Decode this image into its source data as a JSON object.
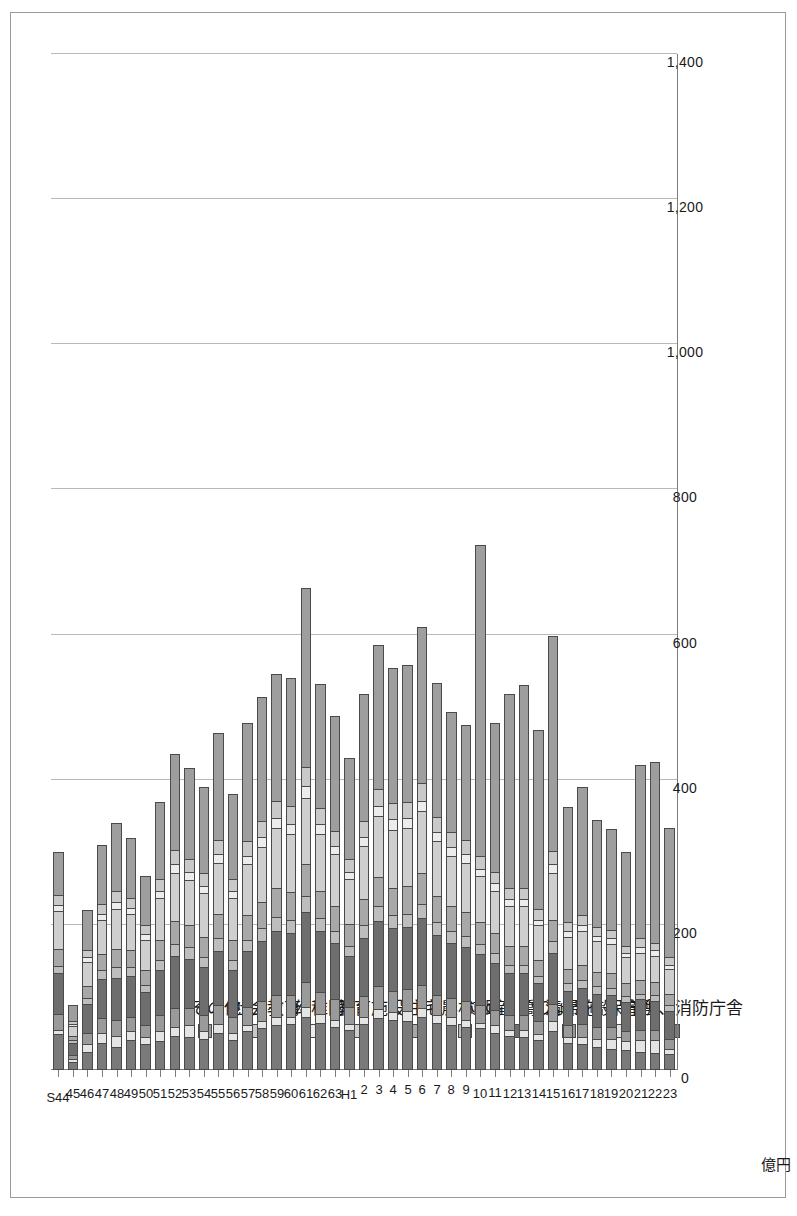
{
  "figure": {
    "unit_label": "億円",
    "orientation": "rotated-90",
    "frame_color": "#9a9a9a"
  },
  "legend": {
    "position": "upper-left",
    "items": [
      {
        "label": "その他",
        "color": "#9e9e9e"
      },
      {
        "label": "社会教育",
        "color": "#c9c9c9"
      },
      {
        "label": "幼稚園",
        "color": "#ececec"
      },
      {
        "label": "教育施設",
        "color": "#cfcfcf"
      },
      {
        "label": "住宅",
        "color": "#a8a8a8"
      },
      {
        "label": "農林水産",
        "color": "#bdbdbd"
      },
      {
        "label": "道路・橋りょう",
        "color": "#6e6e6e"
      },
      {
        "label": "清掃施設",
        "color": "#9a9a9a"
      },
      {
        "label": "保育所",
        "color": "#e4e4e4"
      },
      {
        "label": "庁舎、消防庁舎",
        "color": "#7a7a7a"
      }
    ]
  },
  "chart_data": {
    "type": "bar",
    "subtype": "stacked-horizontal",
    "title": "",
    "xlabel": "",
    "ylabel": "億円",
    "ylim": [
      0,
      1400
    ],
    "ticks": [
      "0",
      "200",
      "400",
      "600",
      "800",
      "1,000",
      "1,200",
      "1,400"
    ],
    "tick_values": [
      0,
      200,
      400,
      600,
      800,
      1000,
      1200,
      1400
    ],
    "grid": true,
    "legend_position": "upper-left",
    "categories": [
      "S44",
      "45",
      "46",
      "47",
      "48",
      "49",
      "50",
      "51",
      "52",
      "53",
      "54",
      "55",
      "56",
      "57",
      "58",
      "59",
      "60",
      "61",
      "62",
      "63",
      "H1",
      "2",
      "3",
      "4",
      "5",
      "6",
      "7",
      "8",
      "9",
      "10",
      "11",
      "12",
      "13",
      "14",
      "15",
      "16",
      "17",
      "18",
      "19",
      "20",
      "21",
      "22",
      "23"
    ],
    "series": [
      {
        "name": "庁舎、消防庁舎",
        "color": "#7a7a7a",
        "values": [
          48,
          10,
          24,
          36,
          30,
          40,
          34,
          38,
          46,
          44,
          42,
          50,
          40,
          52,
          56,
          60,
          62,
          72,
          64,
          58,
          54,
          62,
          70,
          68,
          66,
          72,
          64,
          60,
          58,
          56,
          50,
          46,
          44,
          40,
          52,
          36,
          34,
          30,
          28,
          26,
          24,
          22,
          20
        ]
      },
      {
        "name": "保育所",
        "color": "#e4e4e4",
        "values": [
          6,
          4,
          10,
          14,
          16,
          12,
          10,
          14,
          12,
          16,
          10,
          12,
          10,
          8,
          10,
          12,
          10,
          14,
          12,
          10,
          8,
          10,
          12,
          10,
          14,
          12,
          10,
          12,
          10,
          8,
          10,
          8,
          10,
          8,
          14,
          8,
          10,
          12,
          14,
          12,
          16,
          18,
          8
        ]
      },
      {
        "name": "清掃施設",
        "color": "#9a9a9a",
        "values": [
          22,
          6,
          16,
          20,
          22,
          20,
          16,
          22,
          26,
          24,
          22,
          26,
          22,
          26,
          28,
          30,
          30,
          34,
          30,
          28,
          24,
          28,
          32,
          30,
          30,
          32,
          28,
          26,
          26,
          24,
          22,
          20,
          20,
          18,
          24,
          16,
          18,
          16,
          16,
          14,
          14,
          14,
          14
        ]
      },
      {
        "name": "道路・橋りょう",
        "color": "#6e6e6e",
        "values": [
          56,
          16,
          40,
          54,
          58,
          56,
          46,
          62,
          72,
          68,
          66,
          74,
          64,
          76,
          82,
          88,
          86,
          96,
          84,
          78,
          70,
          80,
          90,
          86,
          86,
          92,
          82,
          76,
          74,
          70,
          64,
          58,
          58,
          52,
          70,
          48,
          50,
          46,
          44,
          40,
          42,
          40,
          38
        ]
      },
      {
        "name": "農林水産",
        "color": "#bdbdbd",
        "values": [
          10,
          4,
          8,
          12,
          14,
          12,
          10,
          14,
          16,
          16,
          14,
          18,
          14,
          16,
          18,
          20,
          18,
          22,
          18,
          16,
          14,
          18,
          20,
          18,
          18,
          20,
          18,
          16,
          16,
          14,
          14,
          12,
          12,
          10,
          16,
          10,
          10,
          10,
          10,
          8,
          8,
          8,
          8
        ]
      },
      {
        "name": "住宅",
        "color": "#a8a8a8",
        "values": [
          24,
          6,
          16,
          22,
          26,
          24,
          20,
          28,
          32,
          30,
          28,
          34,
          28,
          34,
          36,
          40,
          38,
          44,
          38,
          34,
          30,
          36,
          40,
          38,
          38,
          42,
          36,
          34,
          32,
          30,
          28,
          26,
          26,
          22,
          30,
          20,
          22,
          20,
          20,
          18,
          18,
          18,
          16
        ]
      },
      {
        "name": "教育施設",
        "color": "#cfcfcf",
        "values": [
          52,
          14,
          34,
          48,
          54,
          50,
          42,
          58,
          66,
          62,
          60,
          70,
          58,
          70,
          76,
          82,
          80,
          92,
          78,
          72,
          62,
          74,
          84,
          80,
          80,
          86,
          76,
          70,
          68,
          64,
          58,
          54,
          54,
          48,
          64,
          44,
          46,
          42,
          40,
          36,
          38,
          36,
          34
        ]
      },
      {
        "name": "幼稚園",
        "color": "#ececec",
        "values": [
          8,
          2,
          6,
          8,
          10,
          8,
          8,
          10,
          12,
          12,
          10,
          12,
          10,
          12,
          14,
          14,
          14,
          16,
          14,
          12,
          10,
          12,
          14,
          14,
          14,
          14,
          12,
          12,
          12,
          10,
          10,
          10,
          10,
          8,
          12,
          8,
          8,
          8,
          8,
          6,
          8,
          8,
          6
        ]
      },
      {
        "name": "社会教育",
        "color": "#c9c9c9",
        "values": [
          14,
          4,
          10,
          14,
          16,
          14,
          12,
          16,
          20,
          18,
          18,
          20,
          16,
          20,
          22,
          24,
          24,
          26,
          22,
          20,
          18,
          22,
          24,
          22,
          22,
          24,
          22,
          20,
          20,
          18,
          16,
          16,
          16,
          14,
          18,
          12,
          14,
          12,
          12,
          10,
          12,
          10,
          10
        ]
      },
      {
        "name": "その他",
        "color": "#9e9e9e",
        "values": [
          60,
          24,
          56,
          82,
          94,
          84,
          70,
          108,
          134,
          126,
          120,
          148,
          118,
          164,
          172,
          176,
          178,
          248,
          172,
          160,
          140,
          176,
          200,
          188,
          190,
          216,
          186,
          168,
          160,
          430,
          206,
          268,
          280,
          248,
          298,
          160,
          178,
          148,
          140,
          130,
          240,
          250,
          180
        ]
      }
    ],
    "totals": [
      300,
      90,
      220,
      310,
      340,
      320,
      268,
      370,
      436,
      416,
      390,
      464,
      380,
      478,
      514,
      546,
      540,
      664,
      532,
      488,
      430,
      518,
      586,
      554,
      558,
      610,
      534,
      494,
      476,
      706,
      478,
      518,
      530,
      468,
      598,
      362,
      390,
      344,
      332,
      300,
      420,
      424,
      334
    ]
  }
}
